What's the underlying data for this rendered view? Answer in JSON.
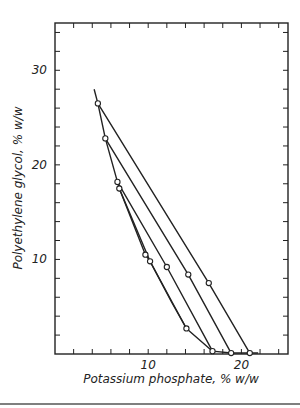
{
  "chart_data": {
    "type": "line",
    "title": "",
    "xlabel": "Potassium phosphate, % w/w",
    "ylabel": "Polyethylene glycol, % w/w",
    "xlim": [
      0,
      25
    ],
    "ylim": [
      0,
      35
    ],
    "xticks_labeled": [
      10,
      20
    ],
    "yticks_labeled": [
      10,
      20,
      30
    ],
    "x_minor_step": 2,
    "y_minor_step": 2,
    "grid": false,
    "binodal_curve": {
      "x": [
        4.2,
        4.6,
        5.4,
        6.7,
        6.9,
        9.7,
        10.2,
        12.5,
        14.1,
        16.9,
        18.9,
        20.9,
        21.8
      ],
      "y": [
        28.0,
        26.5,
        22.8,
        18.2,
        17.5,
        10.5,
        9.8,
        5.5,
        2.7,
        0.3,
        0.1,
        0.1,
        0.1
      ]
    },
    "tie_lines": [
      {
        "name": "Tie line 1",
        "points": [
          [
            4.6,
            26.5
          ],
          [
            16.5,
            7.5
          ],
          [
            20.9,
            0.1
          ]
        ]
      },
      {
        "name": "Tie line 2",
        "points": [
          [
            5.4,
            22.8
          ],
          [
            14.3,
            8.4
          ],
          [
            18.9,
            0.1
          ]
        ]
      },
      {
        "name": "Tie line 3",
        "points": [
          [
            6.7,
            18.2
          ],
          [
            12.0,
            9.2
          ],
          [
            16.9,
            0.3
          ]
        ]
      },
      {
        "name": "Tie line 4",
        "points": [
          [
            6.9,
            17.5
          ],
          [
            10.2,
            9.8
          ],
          [
            14.1,
            2.7
          ]
        ]
      }
    ],
    "markers": [
      [
        4.6,
        26.5
      ],
      [
        5.4,
        22.8
      ],
      [
        6.7,
        18.2
      ],
      [
        6.9,
        17.5
      ],
      [
        9.7,
        10.5
      ],
      [
        10.2,
        9.8
      ],
      [
        12.0,
        9.2
      ],
      [
        14.3,
        8.4
      ],
      [
        16.5,
        7.5
      ],
      [
        14.1,
        2.7
      ],
      [
        16.9,
        0.3
      ],
      [
        18.9,
        0.1
      ],
      [
        20.9,
        0.1
      ]
    ]
  },
  "axes": {
    "x_label": "Potassium phosphate, % w/w",
    "y_label": "Polyethylene glycol, % w/w",
    "x_tick_labels": [
      "10",
      "20"
    ],
    "y_tick_labels": [
      "10",
      "20",
      "30"
    ]
  }
}
